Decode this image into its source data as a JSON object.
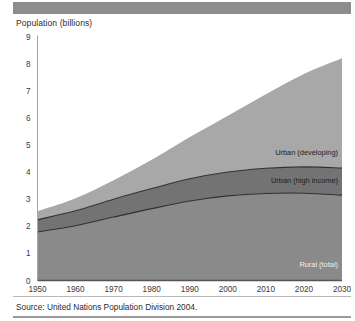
{
  "figure": {
    "title": "Population (billions)",
    "source": "Source: United Nations Population Division 2004.",
    "topbar_color": "#8d8d8d",
    "rule_color": "#9a9a9a"
  },
  "chart_data": {
    "type": "area",
    "stacked": true,
    "title": "Population (billions)",
    "xlabel": "",
    "ylabel": "Population (billions)",
    "xlim": [
      1950,
      2030
    ],
    "ylim": [
      0,
      9
    ],
    "yticks": [
      0,
      1,
      2,
      3,
      4,
      5,
      6,
      7,
      8,
      9
    ],
    "xticks": [
      1950,
      1960,
      1970,
      1980,
      1990,
      2000,
      2010,
      2020,
      2030
    ],
    "grid": false,
    "legend": "inline-annotations",
    "x": [
      1950,
      1960,
      1970,
      1980,
      1990,
      2000,
      2010,
      2020,
      2030
    ],
    "series": [
      {
        "name": "Rural (total)",
        "color": "#8a8a8a",
        "label_color": "#efefef",
        "values": [
          1.79,
          2.02,
          2.34,
          2.65,
          2.93,
          3.12,
          3.21,
          3.22,
          3.15
        ]
      },
      {
        "name": "Urban (high income)",
        "color": "#737373",
        "label_color": "#1c1c1c",
        "values": [
          0.45,
          0.55,
          0.66,
          0.74,
          0.82,
          0.88,
          0.93,
          0.97,
          1.0
        ]
      },
      {
        "name": "Urban (developing)",
        "color": "#a8a8a8",
        "label_color": "#1c1c1c",
        "values": [
          0.31,
          0.46,
          0.7,
          1.06,
          1.54,
          2.08,
          2.73,
          3.43,
          4.05
        ]
      }
    ],
    "cumulative_totals": [
      2.55,
      3.03,
      3.7,
      4.45,
      5.29,
      6.08,
      6.87,
      7.62,
      8.2
    ],
    "divider_line_color": "#2f2f2f",
    "axis_color": "#a6a6a6"
  }
}
